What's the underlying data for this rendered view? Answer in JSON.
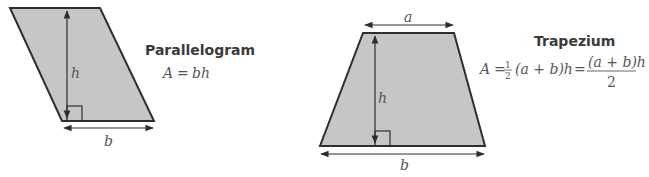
{
  "parallelogram": {
    "title": "Parallelogram",
    "formula": {
      "lhs": "A",
      "eq": "=",
      "rhs": "bh"
    },
    "labels": {
      "height": "h",
      "base": "b"
    }
  },
  "trapezium": {
    "title": "Trapezium",
    "formula": {
      "lhs": "A",
      "eq1": "=",
      "half_num": "1",
      "half_den": "2",
      "paren_expr": "(a + b)h",
      "eq2": "=",
      "frac_num": "(a + b)h",
      "frac_den": "2"
    },
    "labels": {
      "top": "a",
      "height": "h",
      "base": "b"
    }
  },
  "colors": {
    "fill": "#c6c6c6",
    "stroke": "#2e2e2e",
    "text": "#555555",
    "title": "#3a3a3a"
  }
}
